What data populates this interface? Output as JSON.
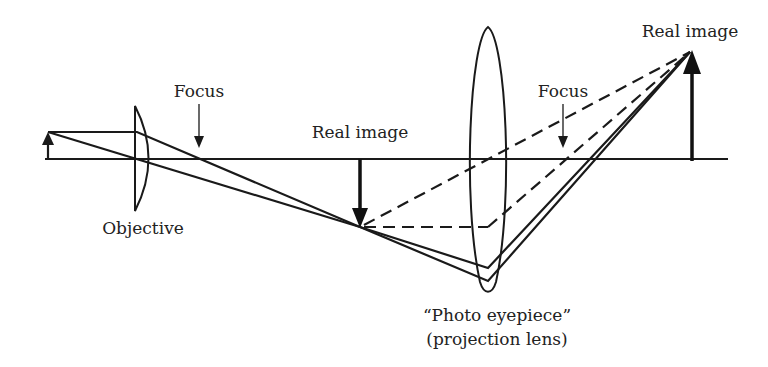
{
  "diagram": {
    "type": "ray-optics",
    "labels": {
      "objective": "Objective",
      "focus_objective": "Focus",
      "intermediate_image": "Real image",
      "focus_eyepiece": "Focus",
      "final_image": "Real image",
      "eyepiece_line1": "“Photo eyepiece”",
      "eyepiece_line2": "(projection lens)"
    },
    "elements": {
      "optical_axis": {
        "x1": 45,
        "x2": 728,
        "y": 159
      },
      "object_arrow": {
        "x": 48,
        "y_base": 159,
        "y_tip": 133
      },
      "objective_lens": {
        "x": 135,
        "y_top": 106,
        "y_bottom": 211,
        "shape": "plano-convex"
      },
      "focus_objective_marker": {
        "x": 199
      },
      "intermediate_image_arrow": {
        "x": 360,
        "y_base": 159,
        "y_tip": 227,
        "direction": "down"
      },
      "eyepiece_lens": {
        "x": 488,
        "y_top": 27,
        "y_bottom": 292,
        "shape": "biconvex"
      },
      "focus_eyepiece_marker": {
        "x": 563
      },
      "final_image_arrow": {
        "x": 692,
        "y_base": 161,
        "y_tip": 51,
        "direction": "up"
      }
    },
    "colors": {
      "ink": "#1a1a1a",
      "background": "#ffffff"
    }
  }
}
